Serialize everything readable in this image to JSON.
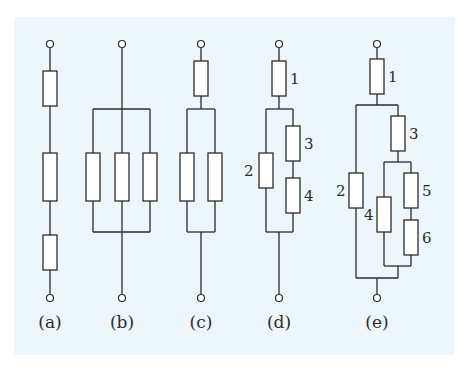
{
  "figure": {
    "background_color": "#edf6fa",
    "line_color": "#2b2b2b",
    "circuits": [
      {
        "id": "a",
        "caption": "(a)",
        "description": "three resistors in series",
        "resistor_labels": []
      },
      {
        "id": "b",
        "caption": "(b)",
        "description": "three resistors in parallel",
        "resistor_labels": []
      },
      {
        "id": "c",
        "caption": "(c)",
        "description": "one resistor in series with two parallel resistors",
        "resistor_labels": []
      },
      {
        "id": "d",
        "caption": "(d)",
        "description": "resistor 1 in series with (2 parallel to series 3-4)",
        "resistor_labels": [
          "1",
          "2",
          "3",
          "4"
        ]
      },
      {
        "id": "e",
        "caption": "(e)",
        "description": "resistor 1 in series with (2 parallel to [3 in series with (4 parallel to series 5-6)])",
        "resistor_labels": [
          "1",
          "2",
          "3",
          "4",
          "5",
          "6"
        ]
      }
    ]
  }
}
